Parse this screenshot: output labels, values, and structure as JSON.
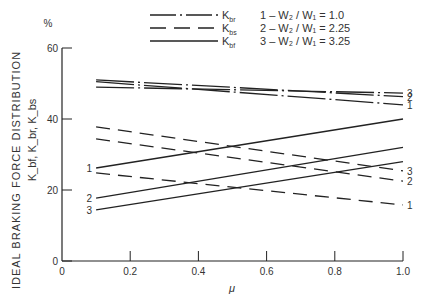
{
  "chart_data": {
    "type": "line",
    "title": "",
    "xlabel": "μ",
    "ylabel": "IDEAL BRAKING FORCE DISTRIBUTION",
    "ylabel_sub": "K_bf, K_br, K_bs",
    "yunit": "%",
    "xlim": [
      0,
      1.0
    ],
    "ylim": [
      0,
      60
    ],
    "xticks": [
      "0",
      "0.2",
      "0.4",
      "0.6",
      "0.8",
      "1.0"
    ],
    "xtick_values": [
      0,
      0.2,
      0.4,
      0.6,
      0.8,
      1.0
    ],
    "yticks": [
      "0",
      "20",
      "40",
      "60"
    ],
    "ytick_values": [
      0,
      20,
      40,
      60
    ],
    "grid": false,
    "legend": {
      "placement": "top",
      "styles": [
        {
          "label": "K",
          "sub": "br",
          "dash": "dashdot"
        },
        {
          "label": "K",
          "sub": "bs",
          "dash": "dashed"
        },
        {
          "label": "K",
          "sub": "bf",
          "dash": "solid"
        }
      ],
      "cases": [
        {
          "id": "1",
          "text": "1 – W₂ / W₁ = 1.0"
        },
        {
          "id": "2",
          "text": "2 – W₂ / W₁ = 2.25"
        },
        {
          "id": "3",
          "text": "3 – W₂ / W₁ = 3.25"
        }
      ]
    },
    "series": [
      {
        "name": "K_br case 1",
        "style": "dashdot",
        "label": "1",
        "x": [
          0.1,
          1.0
        ],
        "values": [
          50.5,
          44.0
        ],
        "label_side": "right"
      },
      {
        "name": "K_br case 2",
        "style": "dashdot",
        "label": "2",
        "x": [
          0.1,
          1.0
        ],
        "values": [
          51.0,
          46.3
        ],
        "label_side": "right"
      },
      {
        "name": "K_br case 3",
        "style": "dashdot",
        "label": "3",
        "x": [
          0.1,
          1.0
        ],
        "values": [
          49.0,
          47.3
        ],
        "label_side": "right"
      },
      {
        "name": "K_bs case 1",
        "style": "dashed",
        "label": "1",
        "x": [
          0.1,
          1.0
        ],
        "values": [
          24.8,
          15.8
        ],
        "label_side": "right"
      },
      {
        "name": "K_bs case 2",
        "style": "dashed",
        "label": "2",
        "x": [
          0.1,
          1.0
        ],
        "values": [
          34.4,
          22.5
        ],
        "label_side": "right"
      },
      {
        "name": "K_bs case 3",
        "style": "dashed",
        "label": "3",
        "x": [
          0.1,
          1.0
        ],
        "values": [
          37.8,
          25.4
        ],
        "label_side": "right"
      },
      {
        "name": "K_bf case 1",
        "style": "solid",
        "label": "1",
        "x": [
          0.1,
          1.0
        ],
        "values": [
          26.2,
          40.0
        ],
        "label_side": "left"
      },
      {
        "name": "K_bf case 2",
        "style": "solid",
        "label": "2",
        "x": [
          0.1,
          1.0
        ],
        "values": [
          17.7,
          32.0
        ],
        "label_side": "left"
      },
      {
        "name": "K_bf case 3",
        "style": "solid",
        "label": "3",
        "x": [
          0.1,
          1.0
        ],
        "values": [
          14.4,
          28.0
        ],
        "label_side": "left"
      }
    ]
  }
}
